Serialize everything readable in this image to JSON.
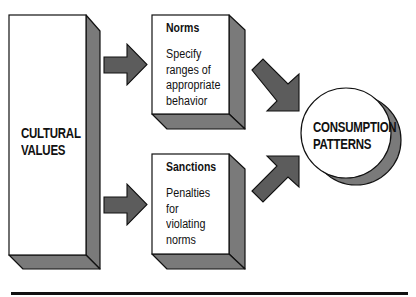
{
  "diagram": {
    "source": {
      "label_line1": "CULTURAL",
      "label_line2": "VALUES"
    },
    "norms": {
      "title": "Norms",
      "body_line1": "Specify",
      "body_line2": "ranges of",
      "body_line3": "appropriate",
      "body_line4": "behavior"
    },
    "sanctions": {
      "title": "Sanctions",
      "body_line1": "Penalties",
      "body_line2": "for",
      "body_line3": "violating",
      "body_line4": "norms"
    },
    "outcome": {
      "label_line1": "CONSUMPTION",
      "label_line2": "PATTERNS"
    },
    "edges": [
      {
        "from": "CULTURAL VALUES",
        "to": "Norms"
      },
      {
        "from": "CULTURAL VALUES",
        "to": "Sanctions"
      },
      {
        "from": "Norms",
        "to": "CONSUMPTION PATTERNS"
      },
      {
        "from": "Sanctions",
        "to": "CONSUMPTION PATTERNS"
      }
    ],
    "colors": {
      "face": "#ffffff",
      "shade": "#7a7a7a",
      "arrow": "#5c5c5c",
      "outline": "#111111"
    }
  }
}
